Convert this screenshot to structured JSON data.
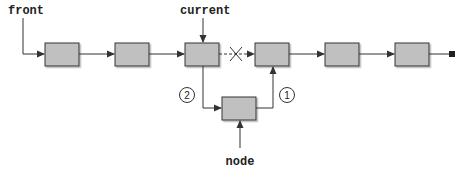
{
  "diagram": {
    "labels": {
      "front": "front",
      "current": "current",
      "node": "node"
    },
    "steps": [
      {
        "id": "1",
        "label": "1",
        "description": "node.next = current.next"
      },
      {
        "id": "2",
        "label": "2",
        "description": "current.next = node"
      }
    ],
    "list_nodes": 6,
    "colors": {
      "node_fill": "#c0c0c0",
      "node_stroke": "#333333",
      "line": "#333333",
      "shadow": "#bdbdbd"
    },
    "broken_link": {
      "from": 3,
      "to": 4,
      "marker": "X",
      "style": "dashed"
    },
    "terminator": "null-square"
  }
}
